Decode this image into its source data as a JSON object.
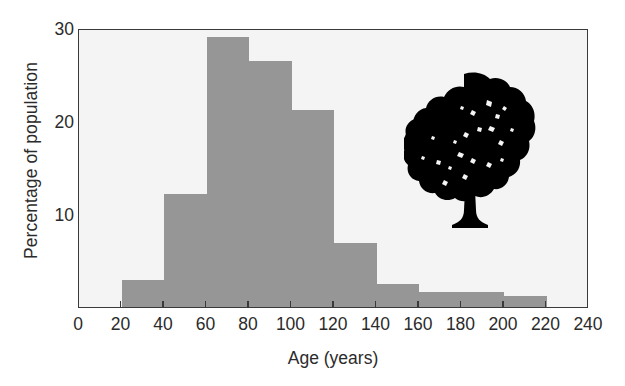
{
  "chart_data": {
    "type": "bar",
    "title": "",
    "subtitle": "",
    "xlabel": "Age (years)",
    "ylabel": "Percentage of population",
    "xlim": [
      0,
      240
    ],
    "ylim": [
      0,
      30
    ],
    "grid": false,
    "legend": null,
    "bin_width": 20,
    "bar_color": "#969696",
    "plot_background": "#f4f4f4",
    "axis_color": "#3a3a3a",
    "xticks": [
      0,
      20,
      40,
      60,
      80,
      100,
      120,
      140,
      160,
      180,
      200,
      220,
      240
    ],
    "xtick_labels": [
      "0",
      "20",
      "40",
      "60",
      "80",
      "100",
      "120",
      "140",
      "160",
      "180",
      "200",
      "220",
      "240"
    ],
    "yticks": [
      10,
      20,
      30
    ],
    "ytick_labels": [
      "10",
      "20",
      "30"
    ],
    "categories": [
      "0-20",
      "20-40",
      "40-60",
      "60-80",
      "80-100",
      "100-120",
      "120-140",
      "140-160",
      "160-180",
      "180-200",
      "200-220",
      "220-240"
    ],
    "bins": [
      {
        "start": 0,
        "end": 20,
        "value": 0.0
      },
      {
        "start": 20,
        "end": 40,
        "value": 2.9
      },
      {
        "start": 40,
        "end": 60,
        "value": 12.2
      },
      {
        "start": 60,
        "end": 80,
        "value": 29.0
      },
      {
        "start": 80,
        "end": 100,
        "value": 26.5
      },
      {
        "start": 100,
        "end": 120,
        "value": 21.2
      },
      {
        "start": 120,
        "end": 140,
        "value": 6.9
      },
      {
        "start": 140,
        "end": 160,
        "value": 2.5
      },
      {
        "start": 160,
        "end": 180,
        "value": 1.6
      },
      {
        "start": 180,
        "end": 200,
        "value": 1.6
      },
      {
        "start": 200,
        "end": 220,
        "value": 1.2
      },
      {
        "start": 220,
        "end": 240,
        "value": 0.0
      }
    ],
    "values": [
      0.0,
      2.9,
      12.2,
      29.0,
      26.5,
      21.2,
      6.9,
      2.5,
      1.6,
      1.6,
      1.2,
      0.0
    ],
    "annotations": [
      {
        "name": "tree-silhouette",
        "type": "image",
        "description": "black broadleaf tree silhouette",
        "x_range": [
          155,
          215
        ],
        "y_range": [
          6,
          26
        ]
      }
    ]
  }
}
